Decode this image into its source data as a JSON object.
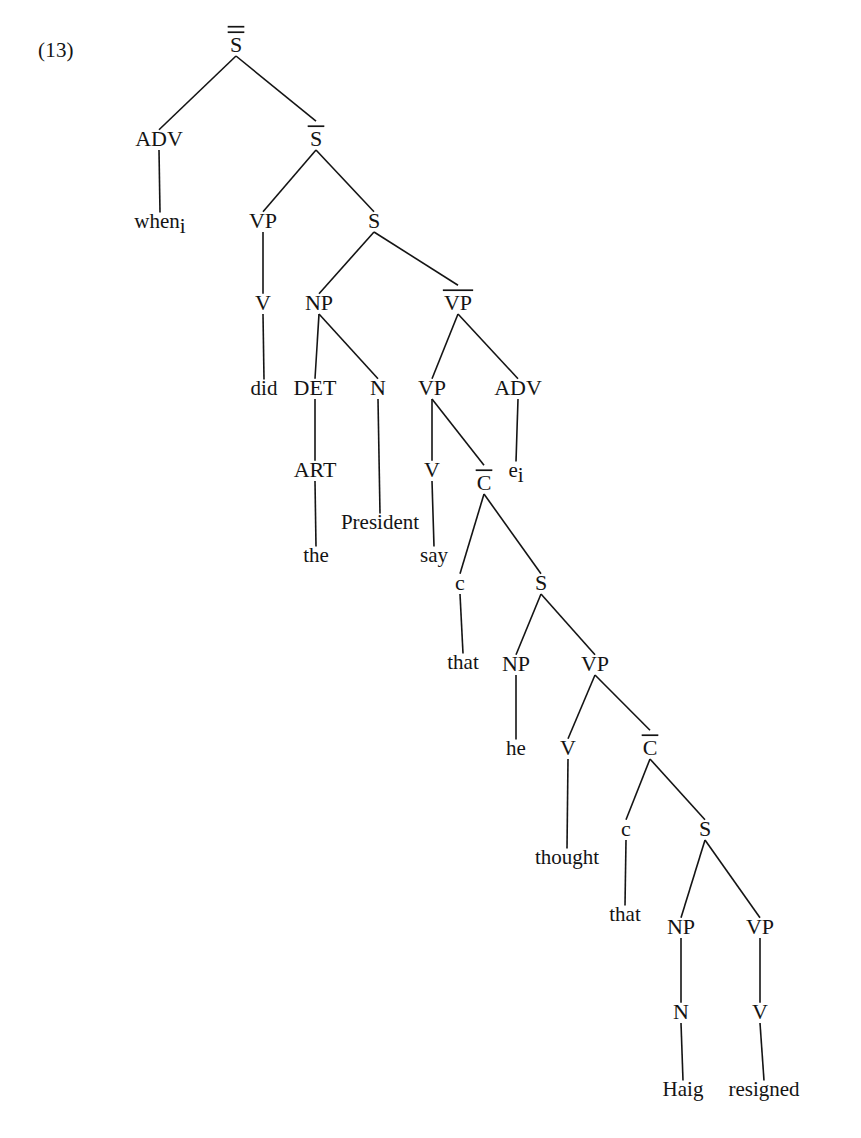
{
  "figure": {
    "example_number": "(13)",
    "caption": "",
    "ink_color": "#141414",
    "background_color": "#ffffff"
  },
  "tree": {
    "type": "phrase-structure-tree",
    "sentence": "when did the President say that he thought that Haig resigned",
    "nodes": [
      {
        "id": "n1",
        "label": "S",
        "bars": 2,
        "kind": "category",
        "x": 236,
        "y": 52
      },
      {
        "id": "n2",
        "label": "ADV",
        "bars": 0,
        "kind": "category",
        "x": 159,
        "y": 146
      },
      {
        "id": "n3",
        "label": "S",
        "bars": 1,
        "kind": "category",
        "x": 316,
        "y": 146
      },
      {
        "id": "n4",
        "label": "when",
        "bars": 0,
        "kind": "terminal",
        "subscript": "i",
        "x": 160,
        "y": 228
      },
      {
        "id": "n5",
        "label": "VP",
        "bars": 0,
        "kind": "category",
        "x": 263,
        "y": 228
      },
      {
        "id": "n6",
        "label": "S",
        "bars": 0,
        "kind": "category",
        "x": 374,
        "y": 228
      },
      {
        "id": "n7",
        "label": "V",
        "bars": 0,
        "kind": "category",
        "x": 263,
        "y": 310
      },
      {
        "id": "n8",
        "label": "NP",
        "bars": 0,
        "kind": "category",
        "x": 319,
        "y": 310
      },
      {
        "id": "n9",
        "label": "VP",
        "bars": 1,
        "kind": "category",
        "x": 458,
        "y": 310
      },
      {
        "id": "n10",
        "label": "did",
        "bars": 0,
        "kind": "terminal",
        "x": 264,
        "y": 395
      },
      {
        "id": "n11",
        "label": "DET",
        "bars": 0,
        "kind": "category",
        "x": 315,
        "y": 395
      },
      {
        "id": "n12",
        "label": "N",
        "bars": 0,
        "kind": "category",
        "x": 378,
        "y": 395
      },
      {
        "id": "n13",
        "label": "VP",
        "bars": 0,
        "kind": "category",
        "x": 432,
        "y": 395
      },
      {
        "id": "n14",
        "label": "ADV",
        "bars": 0,
        "kind": "category",
        "x": 518,
        "y": 395
      },
      {
        "id": "n15",
        "label": "ART",
        "bars": 0,
        "kind": "category",
        "x": 315,
        "y": 477
      },
      {
        "id": "n16",
        "label": "V",
        "bars": 0,
        "kind": "category",
        "x": 432,
        "y": 477
      },
      {
        "id": "n17",
        "label": "e",
        "bars": 0,
        "kind": "terminal",
        "subscript": "i",
        "x": 516,
        "y": 477
      },
      {
        "id": "n18",
        "label": "C",
        "bars": 1,
        "kind": "category",
        "x": 484,
        "y": 490
      },
      {
        "id": "n19",
        "label": "President",
        "bars": 0,
        "kind": "terminal",
        "x": 380,
        "y": 529
      },
      {
        "id": "n20",
        "label": "the",
        "bars": 0,
        "kind": "terminal",
        "x": 316,
        "y": 562
      },
      {
        "id": "n21",
        "label": "say",
        "bars": 0,
        "kind": "terminal",
        "x": 434,
        "y": 562
      },
      {
        "id": "n22",
        "label": "c",
        "bars": 0,
        "kind": "category",
        "x": 460,
        "y": 590
      },
      {
        "id": "n23",
        "label": "S",
        "bars": 0,
        "kind": "category",
        "x": 541,
        "y": 590
      },
      {
        "id": "n24",
        "label": "that",
        "bars": 0,
        "kind": "terminal",
        "x": 463,
        "y": 669
      },
      {
        "id": "n25",
        "label": "NP",
        "bars": 0,
        "kind": "category",
        "x": 516,
        "y": 671
      },
      {
        "id": "n26",
        "label": "VP",
        "bars": 0,
        "kind": "category",
        "x": 595,
        "y": 671
      },
      {
        "id": "n27",
        "label": "he",
        "bars": 0,
        "kind": "terminal",
        "x": 516,
        "y": 755
      },
      {
        "id": "n28",
        "label": "V",
        "bars": 0,
        "kind": "category",
        "x": 568,
        "y": 755
      },
      {
        "id": "n29",
        "label": "C",
        "bars": 1,
        "kind": "category",
        "x": 650,
        "y": 755
      },
      {
        "id": "n30",
        "label": "thought",
        "bars": 0,
        "kind": "terminal",
        "x": 567,
        "y": 864
      },
      {
        "id": "n31",
        "label": "c",
        "bars": 0,
        "kind": "category",
        "x": 626,
        "y": 836
      },
      {
        "id": "n32",
        "label": "S",
        "bars": 0,
        "kind": "category",
        "x": 705,
        "y": 836
      },
      {
        "id": "n33",
        "label": "that",
        "bars": 0,
        "kind": "terminal",
        "x": 625,
        "y": 921
      },
      {
        "id": "n34",
        "label": "NP",
        "bars": 0,
        "kind": "category",
        "x": 681,
        "y": 934
      },
      {
        "id": "n35",
        "label": "VP",
        "bars": 0,
        "kind": "category",
        "x": 760,
        "y": 934
      },
      {
        "id": "n36",
        "label": "N",
        "bars": 0,
        "kind": "category",
        "x": 681,
        "y": 1019
      },
      {
        "id": "n37",
        "label": "V",
        "bars": 0,
        "kind": "category",
        "x": 760,
        "y": 1019
      },
      {
        "id": "n38",
        "label": "Haig",
        "bars": 0,
        "kind": "terminal",
        "x": 683,
        "y": 1096
      },
      {
        "id": "n39",
        "label": "resigned",
        "bars": 0,
        "kind": "terminal",
        "x": 764,
        "y": 1096
      }
    ],
    "edges": [
      {
        "from": "n1",
        "to": "n2"
      },
      {
        "from": "n1",
        "to": "n3"
      },
      {
        "from": "n2",
        "to": "n4"
      },
      {
        "from": "n3",
        "to": "n5"
      },
      {
        "from": "n3",
        "to": "n6"
      },
      {
        "from": "n5",
        "to": "n7"
      },
      {
        "from": "n6",
        "to": "n8"
      },
      {
        "from": "n6",
        "to": "n9"
      },
      {
        "from": "n7",
        "to": "n10"
      },
      {
        "from": "n8",
        "to": "n11"
      },
      {
        "from": "n8",
        "to": "n12"
      },
      {
        "from": "n9",
        "to": "n13"
      },
      {
        "from": "n9",
        "to": "n14"
      },
      {
        "from": "n11",
        "to": "n15"
      },
      {
        "from": "n12",
        "to": "n19"
      },
      {
        "from": "n13",
        "to": "n16"
      },
      {
        "from": "n13",
        "to": "n18"
      },
      {
        "from": "n14",
        "to": "n17"
      },
      {
        "from": "n15",
        "to": "n20"
      },
      {
        "from": "n16",
        "to": "n21"
      },
      {
        "from": "n18",
        "to": "n22"
      },
      {
        "from": "n18",
        "to": "n23"
      },
      {
        "from": "n22",
        "to": "n24"
      },
      {
        "from": "n23",
        "to": "n25"
      },
      {
        "from": "n23",
        "to": "n26"
      },
      {
        "from": "n25",
        "to": "n27"
      },
      {
        "from": "n26",
        "to": "n28"
      },
      {
        "from": "n26",
        "to": "n29"
      },
      {
        "from": "n28",
        "to": "n30"
      },
      {
        "from": "n29",
        "to": "n31"
      },
      {
        "from": "n29",
        "to": "n32"
      },
      {
        "from": "n31",
        "to": "n33"
      },
      {
        "from": "n32",
        "to": "n34"
      },
      {
        "from": "n32",
        "to": "n35"
      },
      {
        "from": "n34",
        "to": "n36"
      },
      {
        "from": "n35",
        "to": "n37"
      },
      {
        "from": "n36",
        "to": "n38"
      },
      {
        "from": "n37",
        "to": "n39"
      }
    ]
  }
}
